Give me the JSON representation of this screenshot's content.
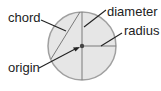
{
  "diagram": {
    "labels": {
      "chord": "chord",
      "diameter": "diameter",
      "radius": "radius",
      "origin": "origin"
    },
    "colors": {
      "circle_fill": "#e6e6e6",
      "circle_stroke": "#9a9a9a",
      "line": "#7a7a7a",
      "leader": "#222222",
      "text": "#222222"
    }
  }
}
